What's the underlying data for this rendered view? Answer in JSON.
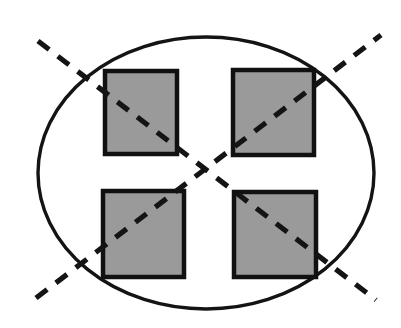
{
  "figure": {
    "width": 401,
    "height": 328,
    "background_color": "#ffffff"
  },
  "chart_data": {
    "type": "diagram",
    "title": "",
    "xlabel": "",
    "ylabel": "",
    "grid": false,
    "legend": null,
    "canvas": {
      "width": 401,
      "height": 328,
      "background": "#ffffff"
    },
    "shapes": [
      {
        "id": "ellipse-outline",
        "kind": "ellipse",
        "cx": 206,
        "cy": 173,
        "rx": 168,
        "ry": 136,
        "fill": "none",
        "stroke": "#141414",
        "stroke_width": 3.4,
        "dashed": false
      },
      {
        "id": "square-top-left",
        "kind": "rect",
        "x": 105,
        "y": 71,
        "width": 72,
        "height": 83,
        "fill": "#9a9a9a",
        "stroke": "#111111",
        "stroke_width": 4.5
      },
      {
        "id": "square-top-right",
        "kind": "rect",
        "x": 233,
        "y": 70,
        "width": 81,
        "height": 85,
        "fill": "#9a9a9a",
        "stroke": "#111111",
        "stroke_width": 4.5
      },
      {
        "id": "square-bottom-left",
        "kind": "rect",
        "x": 103,
        "y": 191,
        "width": 81,
        "height": 86,
        "fill": "#9a9a9a",
        "stroke": "#111111",
        "stroke_width": 4.5
      },
      {
        "id": "square-bottom-right",
        "kind": "rect",
        "x": 234,
        "y": 192,
        "width": 82,
        "height": 85,
        "fill": "#9a9a9a",
        "stroke": "#111111",
        "stroke_width": 4.5
      },
      {
        "id": "dashed-diagonal-nw-se",
        "kind": "line",
        "x1": 38,
        "y1": 41,
        "x2": 376,
        "y2": 300,
        "stroke": "#141414",
        "stroke_width": 5.2,
        "dashed": true,
        "dash_pattern": "14 11"
      },
      {
        "id": "dashed-diagonal-sw-ne",
        "kind": "line",
        "x1": 36,
        "y1": 298,
        "x2": 381,
        "y2": 35,
        "stroke": "#141414",
        "stroke_width": 5.2,
        "dashed": true,
        "dash_pattern": "14 11"
      }
    ],
    "colors": {
      "square_fill": "#9a9a9a",
      "outline": "#141414",
      "background": "#ffffff"
    },
    "counts": {
      "ellipses": 1,
      "squares": 4,
      "dashed_lines": 2
    },
    "annotations": []
  }
}
